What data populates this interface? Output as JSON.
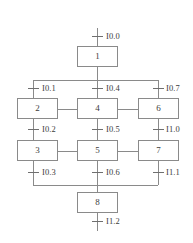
{
  "diagram": {
    "type": "sequential-function-chart",
    "background_color": "#ffffff",
    "line_color": "#8a8a8a",
    "text_color": "#3c3c3c",
    "steps": [
      {
        "id": "step-1",
        "label": "1"
      },
      {
        "id": "step-2",
        "label": "2"
      },
      {
        "id": "step-3",
        "label": "3"
      },
      {
        "id": "step-4",
        "label": "4"
      },
      {
        "id": "step-5",
        "label": "5"
      },
      {
        "id": "step-6",
        "label": "6"
      },
      {
        "id": "step-7",
        "label": "7"
      },
      {
        "id": "step-8",
        "label": "8"
      }
    ],
    "transitions": [
      {
        "id": "t-i00",
        "label": "I0.0"
      },
      {
        "id": "t-i01",
        "label": "I0.1"
      },
      {
        "id": "t-i02",
        "label": "I0.2"
      },
      {
        "id": "t-i03",
        "label": "I0.3"
      },
      {
        "id": "t-i04",
        "label": "I0.4"
      },
      {
        "id": "t-i05",
        "label": "I0.5"
      },
      {
        "id": "t-i06",
        "label": "I0.6"
      },
      {
        "id": "t-i07",
        "label": "I0.7"
      },
      {
        "id": "t-i10",
        "label": "I1.0"
      },
      {
        "id": "t-i11",
        "label": "I1.1"
      },
      {
        "id": "t-i12",
        "label": "I1.2"
      }
    ]
  }
}
